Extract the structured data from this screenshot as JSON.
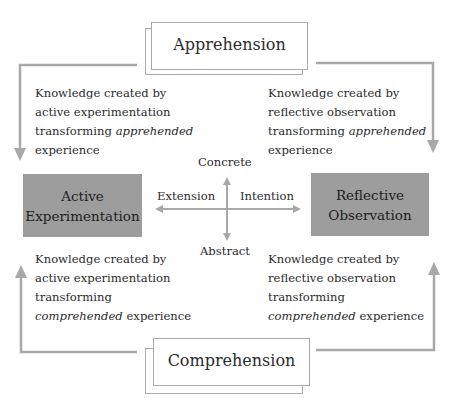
{
  "diagram": {
    "top_mode": {
      "label": "Apprehension"
    },
    "bottom_mode": {
      "label": "Comprehension"
    },
    "left_box": {
      "line1": "Active",
      "line2": "Experimentation"
    },
    "right_box": {
      "line1": "Reflective",
      "line2": "Observation"
    },
    "axes": {
      "top": "Concrete",
      "bottom": "Abstract",
      "left": "Extension",
      "right": "Intention"
    },
    "quadrants": {
      "top_left": {
        "line1": "Knowledge created by",
        "line2": "active experimentation",
        "line3_plain": "transforming ",
        "line3_italic": "apprehended",
        "line4": "experience"
      },
      "top_right": {
        "line1": "Knowledge created by",
        "line2": "reflective observation",
        "line3_plain": "transforming ",
        "line3_italic": "apprehended",
        "line4": "experience"
      },
      "bottom_left": {
        "line1": "Knowledge created by",
        "line2": "active experimentation",
        "line3": "transforming",
        "line4_italic": "comprehended",
        "line4_plain": " experience"
      },
      "bottom_right": {
        "line1": "Knowledge created by",
        "line2": "reflective observation",
        "line3": "transforming",
        "line4_italic": "comprehended",
        "line4_plain": " experience"
      }
    },
    "colors": {
      "box_fill": "#9d9d9d",
      "line": "#a9a9a9",
      "text": "#2b2b2b"
    }
  }
}
